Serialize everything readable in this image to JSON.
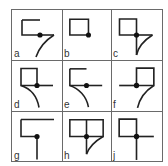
{
  "figure": {
    "line_color": "#222222",
    "border_color": "#6a6a6a",
    "cells": [
      {
        "label": "a",
        "col": 0,
        "row": 0,
        "lines": [
          "M10 10 H28",
          "M10 10 V25 H28",
          "M28 25 H42",
          "M42 25 C34 30 27 38 24 47"
        ],
        "dot": [
          28,
          25
        ]
      },
      {
        "label": "b",
        "col": 1,
        "row": 0,
        "lines": [
          "M8 9 H27 V25 H8 Z"
        ],
        "dot": [
          27,
          25
        ]
      },
      {
        "label": "c",
        "col": 2,
        "row": 0,
        "lines": [
          "M8 9 H25 V25 H8 Z",
          "M25 25 H41",
          "M25 25 V45",
          "M41 25 C33 30 27 36 25 45"
        ],
        "dot": [
          25,
          25
        ]
      },
      {
        "label": "d",
        "col": 0,
        "row": 1,
        "lines": [
          "M9 8 H25 V25 H9 Z",
          "M25 25 H41",
          "M9 25 C18 28 25 35 27 47"
        ],
        "dot": [
          25,
          25
        ]
      },
      {
        "label": "e",
        "col": 1,
        "row": 1,
        "lines": [
          "M8 8 H25",
          "M8 8 V25 H25",
          "M25 25 H41",
          "M8 25 C17 28 25 36 27 47"
        ],
        "dot": [
          25,
          25
        ]
      },
      {
        "label": "f",
        "col": 2,
        "row": 1,
        "lines": [
          "M25 8 H42 V25 H25 Z",
          "M8 25 H25",
          "M42 25 C34 30 28 38 26 47"
        ],
        "dot": [
          25,
          25
        ]
      },
      {
        "label": "g",
        "col": 0,
        "row": 2,
        "lines": [
          "M9 8 H42",
          "M9 8 V25 H25",
          "M25 25 V48"
        ],
        "dot": [
          25,
          25
        ]
      },
      {
        "label": "h",
        "col": 1,
        "row": 2,
        "lines": [
          "M8 8 H42 V25 H8 Z",
          "M25 8 V25",
          "M25 25 V43",
          "M42 25 C35 29 28 35 25 43"
        ],
        "dot": [
          25,
          25
        ]
      },
      {
        "label": "j",
        "col": 2,
        "row": 2,
        "lines": [
          "M8 8 H25 V25 H8 Z",
          "M25 25 H42",
          "M25 25 V48"
        ],
        "dot": [
          25,
          25
        ]
      }
    ]
  }
}
